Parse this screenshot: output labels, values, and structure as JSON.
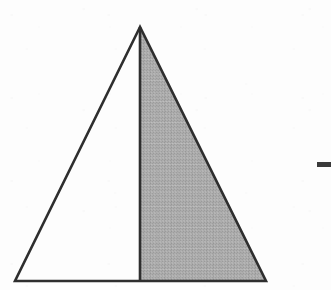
{
  "figure": {
    "background_color": "#fdfdfd",
    "stroke_color": "#2e2e2e",
    "shade_color": "#a9a9a9",
    "shade_texture": "dither-hatch",
    "stroke_width": 2.6,
    "canvas": {
      "width": 331,
      "height": 290
    },
    "vertices": {
      "apex": {
        "label": "apex",
        "x": 140,
        "y": 27
      },
      "bottom_left": {
        "label": "bottom-left",
        "x": 15,
        "y": 281
      },
      "bottom_right": {
        "label": "bottom-right",
        "x": 266,
        "y": 281
      },
      "base_midpoint": {
        "label": "base-midpoint",
        "x": 140,
        "y": 281
      }
    },
    "outline_path": "M140,27 L15,281 L266,281 Z",
    "altitude_path": "M140,27 L140,281",
    "shaded_region_path": "M140,27 L266,281 L140,281 Z",
    "shaded_region_name": "right-half",
    "unshaded_region_name": "left-half",
    "base_length_px": 251,
    "height_px": 254
  },
  "marks": {
    "right_dash": {
      "name": "right-edge-dash",
      "x": 317,
      "y": 162,
      "width": 14,
      "height": 5,
      "color": "#3a3a3a",
      "clipped_at_right_edge": true
    }
  }
}
